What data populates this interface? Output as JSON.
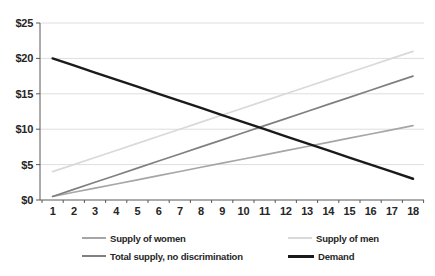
{
  "chart_data": {
    "type": "line",
    "title": "",
    "xlabel": "",
    "ylabel": "",
    "x": [
      1,
      2,
      3,
      4,
      5,
      6,
      7,
      8,
      9,
      10,
      11,
      12,
      13,
      14,
      15,
      16,
      17,
      18
    ],
    "ylim": [
      0,
      25
    ],
    "y_ticks": [
      {
        "value": 0,
        "label": "$0"
      },
      {
        "value": 5,
        "label": "$5"
      },
      {
        "value": 10,
        "label": "$10"
      },
      {
        "value": 15,
        "label": "$15"
      },
      {
        "value": 20,
        "label": "$20"
      },
      {
        "value": 25,
        "label": "$25"
      }
    ],
    "grid": true,
    "legend_position": "bottom",
    "series": [
      {
        "name": "Supply of women",
        "color": "#a6a6a6",
        "stroke_width": 1.7,
        "values": [
          0.5,
          1.09,
          1.68,
          2.26,
          2.85,
          3.44,
          4.03,
          4.62,
          5.21,
          5.79,
          6.38,
          6.97,
          7.56,
          8.15,
          8.74,
          9.32,
          9.91,
          10.5
        ]
      },
      {
        "name": "Supply of men",
        "color": "#d9d9d9",
        "stroke_width": 1.7,
        "values": [
          4,
          5,
          6,
          7,
          8,
          9,
          10,
          11,
          12,
          13,
          14,
          15,
          16,
          17,
          18,
          19,
          20,
          21
        ]
      },
      {
        "name": "Total supply, no discrimination",
        "color": "#808080",
        "stroke_width": 1.7,
        "values": [
          0.5,
          1.5,
          2.5,
          3.5,
          4.5,
          5.5,
          6.5,
          7.5,
          8.5,
          9.5,
          10.5,
          11.5,
          12.5,
          13.5,
          14.5,
          15.5,
          16.5,
          17.5
        ]
      },
      {
        "name": "Demand",
        "color": "#1a1a1a",
        "stroke_width": 2.4,
        "values": [
          20,
          19,
          18,
          17,
          16,
          15,
          14,
          13,
          12,
          11,
          10,
          9,
          8,
          7,
          6,
          5,
          4,
          3
        ]
      }
    ],
    "colors": {
      "gridline": "#dedede",
      "axis": "#595959",
      "tick_text": "#262626",
      "background": "#ffffff"
    }
  }
}
